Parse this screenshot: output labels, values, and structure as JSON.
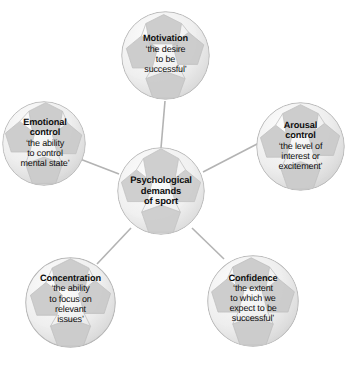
{
  "diagram": {
    "title": "Psychological demands of sport",
    "type": "radial-hub-and-spoke",
    "background_color": "#ffffff",
    "text_color": "#0d0d0d",
    "edge_color": "#b3b3b3",
    "node_shape": "soccer-ball-circle",
    "center": {
      "id": "psychological-demands-of-sport",
      "lines": [
        "Psychological",
        "demands",
        "of sport"
      ]
    },
    "nodes": [
      {
        "id": "motivation",
        "title": "Motivation",
        "desc_lines": [
          "‘the desire",
          "to be",
          "successful’"
        ]
      },
      {
        "id": "arousal-control",
        "title_lines": [
          "Arousal",
          "control"
        ],
        "desc_lines": [
          "‘the level of",
          "interest or",
          "excitement’"
        ]
      },
      {
        "id": "emotional-control",
        "title_lines": [
          "Emotional",
          "control"
        ],
        "desc_lines": [
          "‘the ability",
          "to control",
          "mental state’"
        ]
      },
      {
        "id": "concentration",
        "title": "Concentration",
        "desc_lines": [
          "‘the ability",
          "to focus on",
          "relevant",
          "issues’"
        ]
      },
      {
        "id": "confidence",
        "title": "Confidence",
        "desc_lines": [
          "‘the extent",
          "to which we",
          "expect to be",
          "successful’"
        ]
      }
    ]
  }
}
